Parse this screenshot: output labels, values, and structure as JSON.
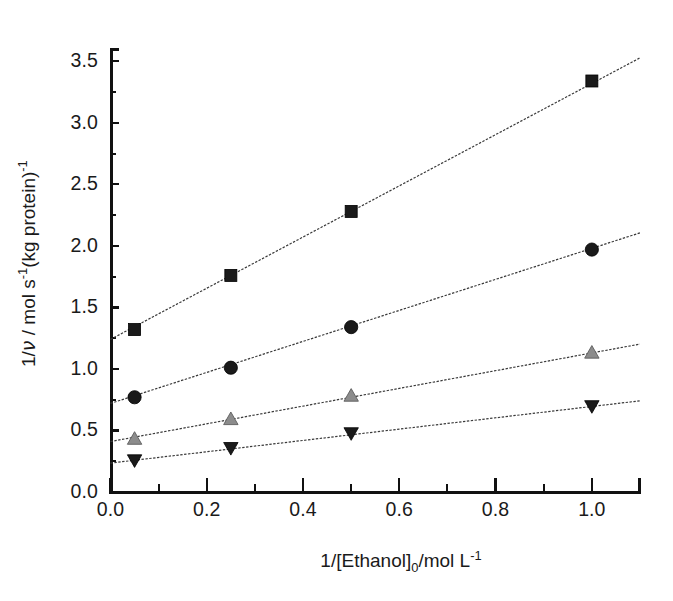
{
  "chart_data": {
    "type": "scatter",
    "title": "",
    "subtitle": "",
    "xlabel": "1/[Ethanol]0/mol L-1",
    "ylabel": "1/v / mol s-1(kg protein)-1",
    "xlim": [
      0.0,
      1.1
    ],
    "ylim": [
      0.0,
      3.6
    ],
    "xticks": [
      "0.0",
      "0.2",
      "0.4",
      "0.6",
      "0.8",
      "1.0"
    ],
    "xtick_values": [
      0.0,
      0.2,
      0.4,
      0.6,
      0.8,
      1.0
    ],
    "yticks": [
      "0.0",
      "0.5",
      "1.0",
      "1.5",
      "2.0",
      "2.5",
      "3.0",
      "3.5"
    ],
    "ytick_values": [
      0.0,
      0.5,
      1.0,
      1.5,
      2.0,
      2.5,
      3.0,
      3.5
    ],
    "x_minor_step": 0.1,
    "y_minor_step": 0.25,
    "grid": false,
    "legend": "none",
    "marker_colors": {
      "series1": "#1a1a1a",
      "series2": "#1a1a1a",
      "series3": "#8c8c8c",
      "series4": "#1a1a1a"
    },
    "line_color": "#3a3a3a",
    "x": [
      0.05,
      0.25,
      0.5,
      1.0
    ],
    "series": [
      {
        "name": "series-1",
        "marker": "square",
        "values": [
          1.32,
          1.76,
          2.28,
          3.34
        ],
        "fit_intercept": 1.24,
        "fit_slope": 2.08,
        "fit_x": [
          0.0,
          1.1
        ]
      },
      {
        "name": "series-2",
        "marker": "circle",
        "values": [
          0.77,
          1.01,
          1.34,
          1.97
        ],
        "fit_intercept": 0.72,
        "fit_slope": 1.26,
        "fit_x": [
          0.0,
          1.1
        ]
      },
      {
        "name": "series-3",
        "marker": "triangle-up",
        "values": [
          0.43,
          0.59,
          0.78,
          1.13
        ],
        "fit_intercept": 0.41,
        "fit_slope": 0.72,
        "fit_x": [
          0.0,
          1.1
        ]
      },
      {
        "name": "series-4",
        "marker": "triangle-down",
        "values": [
          0.26,
          0.36,
          0.48,
          0.7
        ],
        "fit_intercept": 0.235,
        "fit_slope": 0.46,
        "fit_x": [
          0.0,
          1.1
        ]
      }
    ]
  },
  "axes": {
    "y_title_parts": {
      "prefix": "1/",
      "nu": "ν",
      "mid": " / mol s",
      "sup1": "-1",
      "tail": "(kg protein)",
      "sup2": "-1"
    },
    "x_title_parts": {
      "prefix": "1/[Ethanol]",
      "sub": "0",
      "mid": "/mol L",
      "sup": "-1"
    }
  }
}
